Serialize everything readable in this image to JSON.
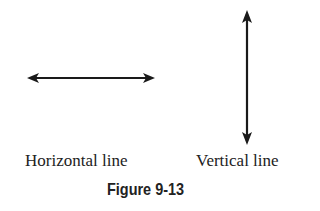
{
  "diagram": {
    "horizontal": {
      "label": "Horizontal line",
      "x1": 27,
      "x2": 155,
      "y": 78
    },
    "vertical": {
      "label": "Vertical line",
      "x": 247,
      "y1": 10,
      "y2": 145
    },
    "caption": "Figure 9-13",
    "line_color": "#1a1a1a"
  }
}
